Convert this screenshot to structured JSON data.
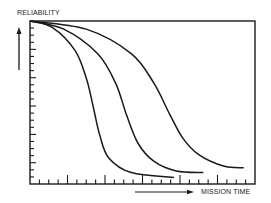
{
  "chart_data": {
    "type": "line",
    "title": "",
    "xlabel": "MISSION TIME",
    "ylabel": "RELIABILITY",
    "grid": false,
    "legend": null,
    "x_ticks": {
      "minor_count": 24,
      "major_every": 4,
      "labels": []
    },
    "y_ticks": {
      "minor_count": 23,
      "labels": []
    },
    "xlim": [
      0,
      1
    ],
    "ylim": [
      0,
      1
    ],
    "annotations": [
      "arrow pointing up beside y-axis",
      "arrow pointing right below x-axis"
    ],
    "series": [
      {
        "name": "curve-1",
        "x": [
          0.0,
          0.1,
          0.2,
          0.25,
          0.28,
          0.31,
          0.35,
          0.45,
          0.64
        ],
        "y": [
          1.0,
          0.96,
          0.82,
          0.65,
          0.48,
          0.3,
          0.16,
          0.07,
          0.04
        ]
      },
      {
        "name": "curve-2",
        "x": [
          0.0,
          0.15,
          0.3,
          0.38,
          0.43,
          0.48,
          0.55,
          0.65,
          0.77
        ],
        "y": [
          1.0,
          0.95,
          0.8,
          0.62,
          0.42,
          0.25,
          0.14,
          0.08,
          0.07
        ]
      },
      {
        "name": "curve-3",
        "x": [
          0.0,
          0.25,
          0.45,
          0.55,
          0.62,
          0.68,
          0.75,
          0.86,
          0.95
        ],
        "y": [
          1.0,
          0.95,
          0.8,
          0.62,
          0.43,
          0.28,
          0.18,
          0.11,
          0.1
        ]
      }
    ]
  },
  "labels": {
    "y_axis": "RELIABILITY",
    "x_axis": "MISSION TIME"
  },
  "colors": {
    "line": "#1a1a1a",
    "background": "#ffffff"
  }
}
